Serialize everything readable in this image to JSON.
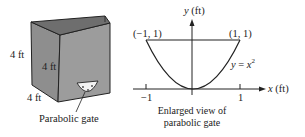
{
  "tank": {
    "dimension_labels": [
      "4 ft",
      "4 ft",
      "4 ft"
    ],
    "gate_label": "Parabolic gate",
    "colors": {
      "front_face": "#9a9a9a",
      "side_face": "#8c8c8c",
      "top_inner": "#7a7a7a",
      "edge": "#222222"
    }
  },
  "graph": {
    "y_axis_label_var": "y",
    "y_axis_label_unit": "(ft)",
    "x_axis_label_var": "x",
    "x_axis_label_unit": "(ft)",
    "point_left": "(−1, 1)",
    "point_right": "(1, 1)",
    "equation_lhs": "y",
    "equation_eq": " = ",
    "equation_var": "x",
    "equation_exp": "2",
    "tick_left": "−1",
    "tick_right": "1",
    "caption_line1": "Enlarged view of",
    "caption_line2": "parabolic gate"
  }
}
